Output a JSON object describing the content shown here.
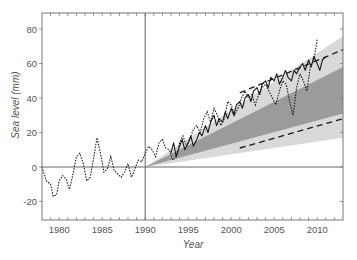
{
  "chart_data": {
    "type": "line",
    "title": "",
    "xlabel": "Year",
    "ylabel": "Sea level (mm)",
    "xlim": [
      1978,
      2013
    ],
    "ylim": [
      -30,
      90
    ],
    "x_ticks": [
      1980,
      1985,
      1990,
      1995,
      2000,
      2005,
      2010
    ],
    "y_ticks": [
      -20,
      0,
      20,
      40,
      60,
      80
    ],
    "reference_lines": {
      "horizontal_y": 0,
      "vertical_x": 1990
    },
    "grid": false,
    "legend": null,
    "colors": {
      "light_band": "#d9d9d9",
      "dark_band": "#9b9b9b",
      "lines": "#1a1a1a",
      "axes": "#777777"
    },
    "bands": [
      {
        "name": "outer projection range",
        "style": "light-gray",
        "x": [
          1990,
          2013
        ],
        "lower": [
          0,
          17
        ],
        "upper": [
          0,
          76
        ]
      },
      {
        "name": "inner projection range",
        "style": "dark-gray",
        "x": [
          1990,
          2013
        ],
        "lower": [
          0,
          31
        ],
        "upper": [
          0,
          58
        ]
      }
    ],
    "series": [
      {
        "name": "tide-gauge observations",
        "style": "dotted",
        "x": [
          1978.0,
          1978.5,
          1979.0,
          1979.3,
          1979.7,
          1980.0,
          1980.4,
          1980.8,
          1981.2,
          1981.6,
          1982.0,
          1982.4,
          1982.8,
          1983.2,
          1983.6,
          1984.0,
          1984.4,
          1984.8,
          1985.2,
          1985.6,
          1986.0,
          1986.4,
          1986.8,
          1987.2,
          1987.6,
          1988.0,
          1988.4,
          1988.8,
          1989.2,
          1989.6,
          1990.0,
          1990.4,
          1990.8,
          1991.2,
          1991.6,
          1992.0,
          1992.4,
          1992.8,
          1993.2,
          1993.6,
          1994.0,
          1994.4,
          1994.8,
          1995.2,
          1995.6,
          1996.0,
          1996.4,
          1996.8,
          1997.2,
          1997.6,
          1998.0,
          1998.4,
          1998.8,
          1999.2,
          1999.6,
          2000.0,
          2000.4,
          2000.8,
          2001.2,
          2001.6,
          2002.0,
          2002.4,
          2002.8,
          2003.2,
          2003.6,
          2004.0,
          2004.4,
          2004.8,
          2005.2,
          2005.6,
          2006.0,
          2006.4,
          2006.8,
          2007.2,
          2007.6,
          2008.0,
          2008.4,
          2008.8,
          2009.2,
          2009.6,
          2010.0
        ],
        "values": [
          0,
          -8,
          -10,
          -17,
          -16,
          -8,
          -5,
          -7,
          -13,
          -4,
          6,
          8,
          2,
          -8,
          -6,
          5,
          17,
          8,
          -3,
          -1,
          6,
          -2,
          -4,
          -6,
          -3,
          2,
          -6,
          -1,
          4,
          3,
          8,
          12,
          10,
          6,
          14,
          16,
          11,
          10,
          4,
          6,
          14,
          18,
          12,
          16,
          22,
          24,
          20,
          28,
          32,
          26,
          34,
          30,
          24,
          28,
          38,
          36,
          30,
          34,
          40,
          44,
          40,
          42,
          36,
          42,
          46,
          48,
          44,
          40,
          36,
          44,
          50,
          48,
          38,
          30,
          46,
          54,
          50,
          44,
          58,
          62,
          74
        ]
      },
      {
        "name": "satellite observations",
        "style": "solid",
        "x": [
          1993.0,
          1993.3,
          1993.6,
          1994.0,
          1994.3,
          1994.6,
          1995.0,
          1995.3,
          1995.6,
          1996.0,
          1996.3,
          1996.6,
          1997.0,
          1997.3,
          1997.6,
          1998.0,
          1998.3,
          1998.6,
          1999.0,
          1999.3,
          1999.6,
          2000.0,
          2000.3,
          2000.6,
          2001.0,
          2001.3,
          2001.6,
          2002.0,
          2002.3,
          2002.6,
          2003.0,
          2003.3,
          2003.6,
          2004.0,
          2004.3,
          2004.6,
          2005.0,
          2005.3,
          2005.6,
          2006.0,
          2006.3,
          2006.6,
          2007.0,
          2007.3,
          2007.6,
          2008.0,
          2008.3,
          2008.6,
          2009.0,
          2009.3,
          2009.6,
          2010.0,
          2010.3,
          2010.6,
          2011.0
        ],
        "values": [
          8,
          14,
          6,
          12,
          16,
          10,
          14,
          18,
          12,
          16,
          20,
          18,
          24,
          20,
          26,
          30,
          24,
          28,
          26,
          32,
          28,
          34,
          30,
          36,
          38,
          34,
          40,
          42,
          38,
          44,
          46,
          42,
          48,
          50,
          46,
          52,
          50,
          54,
          48,
          52,
          56,
          52,
          50,
          56,
          54,
          58,
          60,
          56,
          62,
          58,
          64,
          60,
          56,
          62,
          64
        ]
      },
      {
        "name": "upper projection (dashed)",
        "style": "dashed",
        "x": [
          2001,
          2013
        ],
        "values": [
          43,
          68
        ]
      },
      {
        "name": "lower projection (dashed)",
        "style": "dashed",
        "x": [
          2001,
          2013
        ],
        "values": [
          11,
          28
        ]
      }
    ]
  },
  "axes": {
    "x_title": "Year",
    "y_title": "Sea level (mm)",
    "x_tick_labels": [
      "1980",
      "1985",
      "1990",
      "1995",
      "2000",
      "2005",
      "2010"
    ],
    "y_tick_labels": [
      "-20",
      "0",
      "20",
      "40",
      "60",
      "80"
    ]
  }
}
